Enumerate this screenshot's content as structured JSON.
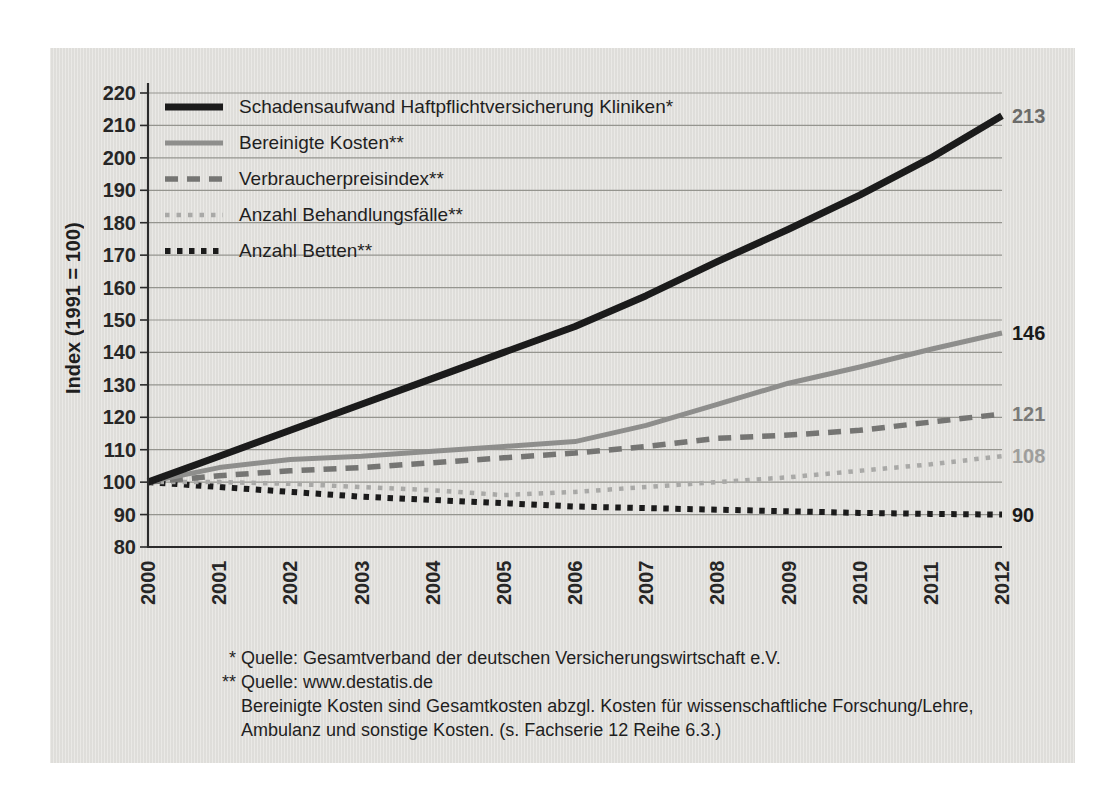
{
  "colors": {
    "page_bg": "#ffffff",
    "panel_bg": "#e2e1dd",
    "gridline": "#95958f",
    "axis_frame": "#2b2b2b",
    "tick": "#2b2b2b",
    "text": "#1f1f1f"
  },
  "chart_data": {
    "type": "line",
    "x": [
      "2000",
      "2001",
      "2002",
      "2003",
      "2004",
      "2005",
      "2006",
      "2007",
      "2008",
      "2009",
      "2010",
      "2011",
      "2012"
    ],
    "title": "",
    "xlabel": "",
    "ylabel": "Index (1991 = 100)",
    "ylim": [
      80,
      220
    ],
    "ytick_step": 10,
    "grid": true,
    "legend_position": "top-left-inside",
    "series": [
      {
        "name": "Schadensaufwand Haftpflichtversicherung Kliniken*",
        "values": [
          100,
          108,
          116,
          124,
          132,
          140,
          148,
          157.5,
          168,
          178,
          188.5,
          200,
          213
        ],
        "end_label": "213",
        "end_label_color": "#6b6b69",
        "color": "#1b1b1b",
        "width": 7,
        "dasharray": "none"
      },
      {
        "name": "Bereinigte Kosten**",
        "values": [
          100,
          104.5,
          107,
          108,
          109.5,
          111,
          112.5,
          117.5,
          124,
          130.5,
          135.5,
          141,
          146
        ],
        "end_label": "146",
        "end_label_color": "#1a1a1a",
        "color": "#8e8e8c",
        "width": 5,
        "dasharray": "none"
      },
      {
        "name": "Verbraucherpreisindex**",
        "values": [
          100,
          102,
          103.5,
          104.5,
          106,
          107.5,
          109,
          111,
          113.5,
          114.5,
          116,
          118.5,
          121
        ],
        "end_label": "121",
        "end_label_color": "#7a7a78",
        "color": "#757573",
        "width": 5.5,
        "dasharray": "13 9"
      },
      {
        "name": "Anzahl Behandlungsfälle**",
        "values": [
          100,
          100,
          99.5,
          98.5,
          97.5,
          96,
          97,
          98.5,
          100,
          101.5,
          103.5,
          105.5,
          108
        ],
        "end_label": "108",
        "end_label_color": "#9e9e9c",
        "color": "#a9a9a7",
        "width": 4.5,
        "dasharray": "4.5 7"
      },
      {
        "name": "Anzahl Betten**",
        "values": [
          100,
          98.5,
          97,
          95.5,
          94.5,
          93.5,
          92.5,
          92,
          91.5,
          91,
          90.5,
          90.2,
          90
        ],
        "end_label": "90",
        "end_label_color": "#1a1a1a",
        "color": "#1b1b1b",
        "width": 6,
        "dasharray": "5.5 6.5"
      }
    ]
  },
  "footnotes": {
    "lines": [
      {
        "marker": "*",
        "text": "Quelle: Gesamtverband der deutschen Versicherungswirtschaft e.V."
      },
      {
        "marker": "**",
        "text": "Quelle: www.destatis.de"
      },
      {
        "marker": "",
        "text": "Bereinigte Kosten sind Gesamtkosten abzgl. Kosten für wissenschaftliche Forschung/Lehre,"
      },
      {
        "marker": "",
        "text": "Ambulanz und sonstige Kosten. (s. Fachserie 12 Reihe 6.3.)"
      }
    ]
  }
}
